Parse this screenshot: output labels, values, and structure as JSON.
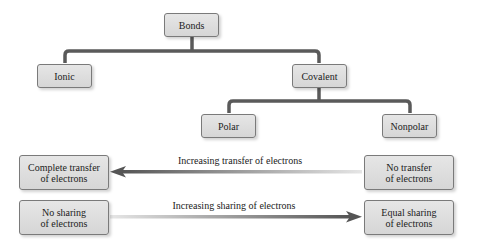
{
  "diagram": {
    "nodes": {
      "bonds": "Bonds",
      "ionic": "Ionic",
      "covalent": "Covalent",
      "polar": "Polar",
      "nonpolar": "Nonpolar"
    },
    "edges": [
      {
        "from": "bonds",
        "to": "ionic"
      },
      {
        "from": "bonds",
        "to": "covalent"
      },
      {
        "from": "covalent",
        "to": "polar"
      },
      {
        "from": "covalent",
        "to": "nonpolar"
      }
    ],
    "scales": [
      {
        "left_box_line1": "Complete transfer",
        "left_box_line2": "of electrons",
        "right_box_line1": "No transfer",
        "right_box_line2": "of electrons",
        "arrow_label": "Increasing transfer of electrons",
        "arrow_direction": "left"
      },
      {
        "left_box_line1": "No sharing",
        "left_box_line2": "of electrons",
        "right_box_line1": "Equal sharing",
        "right_box_line2": "of electrons",
        "arrow_label": "Increasing sharing of electrons",
        "arrow_direction": "right"
      }
    ],
    "colors": {
      "connector": "#5a5a5a",
      "box_fill": "#dedede",
      "box_border": "#7a7a7a",
      "arrow_dark": "#555555",
      "arrow_light": "#e0e0e0"
    }
  }
}
